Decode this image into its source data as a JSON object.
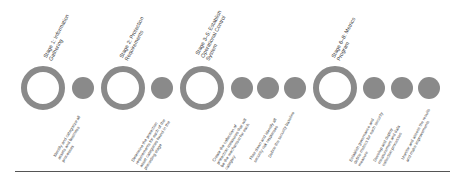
{
  "diagram": {
    "colors": {
      "shape": "#8a8a8a",
      "text": "#444444",
      "baseline": "#555555"
    },
    "stages": [
      {
        "label": "Stage 1: Information Gathering"
      },
      {
        "label": "Stage 2: Protection Requirements"
      },
      {
        "label": "Stage 3–5: Establish Operational Control System"
      },
      {
        "label": "Stage 6–8: Metrics Program"
      }
    ],
    "steps": [
      {
        "label": "Identify and categorize all assets and business processes"
      },
      {
        "label": "Determine the protection requirements for each of the asset categories found in the preceding stage"
      },
      {
        "label": "Create the collection of protection measures that will be the mechanism for each category"
      },
      {
        "label": "Flow down and identify all security risk responses"
      },
      {
        "label": "Define the security baseline"
      },
      {
        "label": "Establish governance and define metrics for each security measure"
      },
      {
        "label": "Develop and deploy measurement and data collection processes"
      },
      {
        "label": "Monitor and assess the results and make improvements"
      }
    ]
  }
}
